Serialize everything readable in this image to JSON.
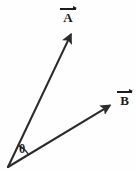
{
  "figure": {
    "kind": "vector-angle-diagram",
    "width": 136,
    "height": 171,
    "background_color": "#fefefe",
    "stroke_color": "#2b2b2b",
    "label_color": "#1c1c1c"
  },
  "labels": {
    "vector_a": "A",
    "vector_b": "B",
    "angle": "θ"
  },
  "chart_data": {
    "type": "scatter",
    "title": "",
    "xlabel": "",
    "ylabel": "",
    "grid": false,
    "legend": "none",
    "origin": {
      "x": 8,
      "y": 167
    },
    "series": [
      {
        "name": "A",
        "label": "A",
        "accent_overline": "arrow",
        "start": {
          "x": 8,
          "y": 167
        },
        "end": {
          "x": 73,
          "y": 30
        },
        "label_position": {
          "x": 60,
          "y": 6
        },
        "arrowhead": "filled-triangle"
      },
      {
        "name": "B",
        "label": "B",
        "accent_overline": "arrow",
        "start": {
          "x": 8,
          "y": 167
        },
        "end": {
          "x": 114,
          "y": 103
        },
        "label_position": {
          "x": 117,
          "y": 89
        },
        "arrowhead": "filled-triangle"
      }
    ],
    "annotations": [
      {
        "name": "angle-arc",
        "label": "θ",
        "vertex": {
          "x": 8,
          "y": 167
        },
        "radius": 24,
        "between": [
          "A",
          "B"
        ],
        "label_position": {
          "x": 19,
          "y": 143
        }
      }
    ]
  }
}
